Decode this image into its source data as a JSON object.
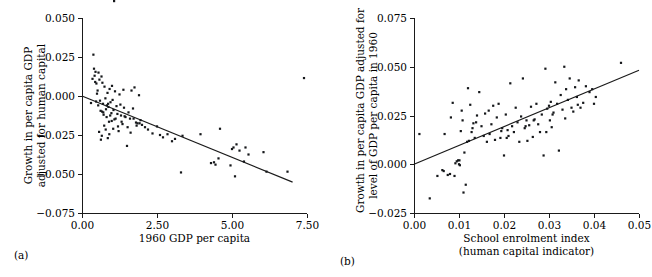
{
  "figure": {
    "panels": [
      {
        "key": "a",
        "subfig_label": "(a)",
        "ylabel_line1": "Growth in per capita GDP",
        "ylabel_line2": "adjusted for human capital",
        "xlabel_line1": "1960  GDP per capita",
        "xlabel_line2": "",
        "y_ticks": [
          "0.050",
          "0.025",
          "0.000",
          "−0.025",
          "−0.050",
          "−0.075"
        ],
        "x_ticks": [
          "0.00",
          "2.50",
          "5.00",
          "7.50"
        ]
      },
      {
        "key": "b",
        "subfig_label": "(b)",
        "ylabel_line1": "Growth in per capita GDP adjusted for",
        "ylabel_line2": "level of GDP per capita in 1960",
        "xlabel_line1": "School enrolment index",
        "xlabel_line2": "(human capital indicator)",
        "y_ticks": [
          "0.075",
          "0.050",
          "0.025",
          "0.000",
          "−0.025"
        ],
        "x_ticks": [
          "0.00",
          "0.01",
          "0.02",
          "0.03",
          "0.04",
          "0.05"
        ]
      }
    ]
  },
  "chart_data": [
    {
      "type": "scatter",
      "panel": "a",
      "title": "",
      "xlabel": "1960  GDP per capita",
      "ylabel": "Growth in per capita GDP adjusted for human capital",
      "xlim": [
        0.0,
        7.5
      ],
      "ylim": [
        -0.075,
        0.05
      ],
      "xticks": [
        0.0,
        2.5,
        5.0,
        7.5
      ],
      "yticks": [
        -0.075,
        -0.05,
        -0.025,
        0.0,
        0.025,
        0.05
      ],
      "grid": false,
      "legend": "none",
      "marker_color": "#15171a",
      "line_color": "#1a1a1a",
      "trend_line": {
        "x": [
          0.0,
          7.02
        ],
        "y": [
          0.0,
          -0.0552
        ]
      },
      "x": [
        0.3,
        0.38,
        0.42,
        0.45,
        0.48,
        0.52,
        0.55,
        0.58,
        0.6,
        0.62,
        0.65,
        0.68,
        0.7,
        0.72,
        0.75,
        0.78,
        0.8,
        0.82,
        0.85,
        0.88,
        0.9,
        0.92,
        0.95,
        0.98,
        1.0,
        1.02,
        1.05,
        1.08,
        1.1,
        1.15,
        1.18,
        1.2,
        1.25,
        1.28,
        1.3,
        1.35,
        1.38,
        1.4,
        1.45,
        1.5,
        1.55,
        1.6,
        1.65,
        1.7,
        1.75,
        1.8,
        1.85,
        1.9,
        1.95,
        2.0,
        0.35,
        0.4,
        0.44,
        0.5,
        0.54,
        0.57,
        0.63,
        0.66,
        0.71,
        0.74,
        0.79,
        0.83,
        0.86,
        0.91,
        0.94,
        0.99,
        1.04,
        1.12,
        1.22,
        1.32,
        1.42,
        1.52,
        1.62,
        1.72,
        1.82,
        1.92,
        2.1,
        2.2,
        2.35,
        2.5,
        2.6,
        2.7,
        2.85,
        3.0,
        3.1,
        3.3,
        3.35,
        3.95,
        4.3,
        4.4,
        4.45,
        4.55,
        4.6,
        4.95,
        5.0,
        5.05,
        5.1,
        5.15,
        5.25,
        5.4,
        5.45,
        5.55,
        6.05,
        6.15,
        6.85,
        7.4,
        0.47,
        0.67,
        0.87,
        1.07
      ],
      "y": [
        -0.0045,
        0.0265,
        0.013,
        0.0155,
        0.008,
        0.0035,
        0.015,
        0.0105,
        -0.003,
        -0.0095,
        0.0125,
        0.0085,
        -0.005,
        -0.012,
        0.006,
        -0.0015,
        -0.0085,
        -0.0135,
        0.002,
        -0.007,
        -0.0165,
        0.0045,
        -0.004,
        -0.011,
        0.0065,
        -0.0025,
        -0.009,
        -0.015,
        0.003,
        -0.0065,
        -0.0115,
        -0.0195,
        0.001,
        -0.0055,
        -0.0125,
        -0.018,
        0.004,
        -0.0075,
        -0.0135,
        -0.032,
        -0.0105,
        -0.0145,
        0.0035,
        -0.008,
        0.0055,
        -0.017,
        -0.0175,
        0.0005,
        -0.0155,
        -0.0185,
        0.011,
        0.0175,
        0.009,
        0.0015,
        -0.006,
        -0.023,
        -0.028,
        -0.0255,
        -0.0105,
        -0.019,
        -0.0215,
        -0.006,
        -0.027,
        -0.0245,
        -0.0125,
        -0.016,
        -0.021,
        -0.0145,
        -0.0225,
        -0.0165,
        -0.013,
        -0.02,
        -0.0235,
        -0.0145,
        -0.019,
        -0.0175,
        -0.02,
        -0.0215,
        -0.024,
        -0.0195,
        -0.025,
        -0.0265,
        -0.0245,
        -0.029,
        -0.0275,
        -0.049,
        -0.0255,
        -0.0245,
        -0.043,
        -0.0425,
        -0.044,
        -0.04,
        -0.021,
        -0.0445,
        -0.034,
        -0.033,
        -0.0515,
        -0.031,
        -0.035,
        -0.042,
        -0.033,
        -0.0375,
        -0.036,
        -0.0485,
        -0.0485,
        0.0115,
        -0.0035,
        -0.01,
        -0.005
      ]
    },
    {
      "type": "scatter",
      "panel": "b",
      "title": "",
      "xlabel": "School enrolment index (human capital indicator)",
      "ylabel": "Growth in per capita GDP adjusted for level of GDP per capita in 1960",
      "xlim": [
        0.0,
        0.05
      ],
      "ylim": [
        -0.025,
        0.075
      ],
      "xticks": [
        0.0,
        0.01,
        0.02,
        0.03,
        0.04,
        0.05
      ],
      "yticks": [
        -0.025,
        0.0,
        0.025,
        0.05,
        0.075
      ],
      "grid": false,
      "legend": "none",
      "marker_color": "#15171a",
      "line_color": "#1a1a1a",
      "trend_line": {
        "x": [
          0.0,
          0.05
        ],
        "y": [
          0.0,
          0.0482
        ]
      },
      "x": [
        0.0012,
        0.0035,
        0.0052,
        0.0063,
        0.0066,
        0.0068,
        0.0075,
        0.008,
        0.0082,
        0.0086,
        0.0092,
        0.0095,
        0.0098,
        0.01,
        0.0101,
        0.0102,
        0.0104,
        0.0106,
        0.0108,
        0.0112,
        0.0115,
        0.0118,
        0.012,
        0.0122,
        0.0125,
        0.0128,
        0.013,
        0.0132,
        0.0135,
        0.014,
        0.0145,
        0.015,
        0.0155,
        0.0158,
        0.0162,
        0.0168,
        0.0172,
        0.0176,
        0.018,
        0.0184,
        0.0188,
        0.0192,
        0.0196,
        0.02,
        0.0204,
        0.0208,
        0.021,
        0.0214,
        0.0218,
        0.0222,
        0.0226,
        0.023,
        0.0234,
        0.0238,
        0.0242,
        0.0246,
        0.025,
        0.0252,
        0.0256,
        0.026,
        0.0264,
        0.0268,
        0.0272,
        0.0276,
        0.028,
        0.0284,
        0.0288,
        0.0292,
        0.0296,
        0.03,
        0.0302,
        0.0304,
        0.0306,
        0.031,
        0.0314,
        0.0318,
        0.0322,
        0.0326,
        0.033,
        0.0334,
        0.0338,
        0.0342,
        0.0346,
        0.035,
        0.0354,
        0.0358,
        0.0362,
        0.0366,
        0.037,
        0.0376,
        0.0382,
        0.039,
        0.0396,
        0.04,
        0.0404,
        0.046,
        0.009,
        0.011,
        0.0138,
        0.0166,
        0.0194,
        0.0206,
        0.0248,
        0.0266,
        0.0294,
        0.0308,
        0.0336,
        0.0364
      ],
      "y": [
        0.0155,
        -0.0175,
        -0.006,
        -0.003,
        -0.0035,
        0.0155,
        -0.0055,
        -0.005,
        0.024,
        0.0315,
        0.0005,
        0.0015,
        0.002,
        0.0,
        0.002,
        -0.0005,
        0.017,
        0.0275,
        0.0225,
        0.006,
        -0.0105,
        0.0115,
        0.039,
        0.012,
        0.0305,
        0.0165,
        0.0185,
        0.021,
        0.0135,
        0.025,
        0.037,
        0.0195,
        0.0145,
        0.026,
        0.0115,
        0.0155,
        0.0205,
        0.03,
        0.0125,
        0.024,
        0.031,
        0.0135,
        0.0185,
        0.0045,
        0.0255,
        0.0175,
        0.0145,
        0.0415,
        0.0195,
        0.0165,
        0.029,
        0.0215,
        0.0115,
        0.0245,
        0.044,
        0.0185,
        0.0225,
        0.012,
        0.02,
        0.0295,
        0.014,
        0.023,
        0.031,
        0.0205,
        0.0165,
        0.0255,
        0.0045,
        0.049,
        0.0285,
        0.03,
        0.0225,
        0.032,
        0.019,
        0.0265,
        0.042,
        0.031,
        0.007,
        0.0355,
        0.028,
        0.05,
        0.0385,
        0.033,
        0.044,
        0.029,
        0.027,
        0.0395,
        0.0345,
        0.043,
        0.029,
        0.0315,
        0.04,
        0.037,
        0.0385,
        0.031,
        0.0345,
        0.052,
        -0.006,
        -0.0145,
        0.0215,
        0.0275,
        0.017,
        0.0135,
        0.0195,
        0.0225,
        0.0165,
        0.0255,
        0.0235,
        0.0305
      ]
    }
  ]
}
